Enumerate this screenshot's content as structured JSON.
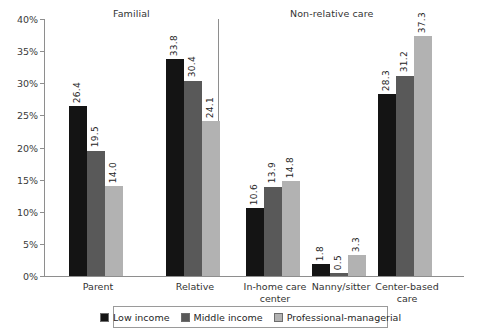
{
  "chart_data": {
    "type": "bar",
    "title": "",
    "xlabel": "",
    "ylabel": "",
    "ylim": [
      0,
      40
    ],
    "ytick_labels": [
      "0%",
      "5%",
      "10%",
      "15%",
      "20%",
      "25%",
      "30%",
      "35%",
      "40%"
    ],
    "ytick_values": [
      0,
      5,
      10,
      15,
      20,
      25,
      30,
      35,
      40
    ],
    "grid": false,
    "legend_position": "bottom",
    "panels": [
      {
        "title": "Familial",
        "categories": [
          "Parent",
          "Relative"
        ]
      },
      {
        "title": "Non-relative care",
        "categories": [
          "In-home care center",
          "Nanny/sitter",
          "Center-based care"
        ]
      }
    ],
    "categories": [
      "Parent",
      "Relative",
      "In-home care center",
      "Nanny/sitter",
      "Center-based care"
    ],
    "series": [
      {
        "name": "Low income",
        "color": "#141414",
        "values": [
          26.4,
          33.8,
          10.6,
          1.8,
          28.3
        ]
      },
      {
        "name": "Middle income",
        "color": "#595959",
        "values": [
          19.5,
          30.4,
          13.9,
          0.5,
          31.2
        ]
      },
      {
        "name": "Professional-managerial",
        "color": "#b2b2b2",
        "values": [
          14.0,
          24.1,
          14.8,
          3.3,
          37.3
        ]
      }
    ],
    "value_labels": {
      "parent": [
        "26.4",
        "19.5",
        "14.0"
      ],
      "relative": [
        "33.8",
        "30.4",
        "24.1"
      ],
      "in_home_care_center": [
        "10.6",
        "13.9",
        "14.8"
      ],
      "nanny_sitter": [
        "1.8",
        "0.5",
        "3.3"
      ],
      "center_based_care": [
        "28.3",
        "31.2",
        "37.3"
      ]
    }
  },
  "panel_titles": {
    "familial": "Familial",
    "nonrelative": "Non-relative care"
  },
  "axis": {
    "ticks": [
      {
        "label": "40%",
        "value": 40
      },
      {
        "label": "35%",
        "value": 35
      },
      {
        "label": "30%",
        "value": 30
      },
      {
        "label": "25%",
        "value": 25
      },
      {
        "label": "20%",
        "value": 20
      },
      {
        "label": "15%",
        "value": 15
      },
      {
        "label": "10%",
        "value": 10
      },
      {
        "label": "5%",
        "value": 5
      },
      {
        "label": "0%",
        "value": 0
      }
    ]
  },
  "categories": [
    {
      "id": "parent",
      "label": "Parent"
    },
    {
      "id": "relative",
      "label": "Relative"
    },
    {
      "id": "in-home-care-center",
      "label": "In-home care\ncenter"
    },
    {
      "id": "nanny-sitter",
      "label": "Nanny/sitter"
    },
    {
      "id": "center-based-care",
      "label": "Center-based\ncare"
    }
  ],
  "legend": {
    "items": [
      {
        "label": "Low income",
        "color": "#141414"
      },
      {
        "label": "Middle income",
        "color": "#595959"
      },
      {
        "label": "Professional-managerial",
        "color": "#b2b2b2"
      }
    ]
  }
}
